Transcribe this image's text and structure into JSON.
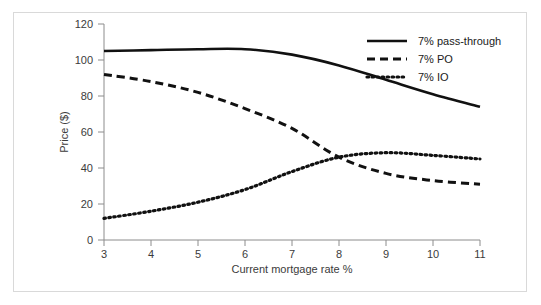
{
  "chart_data": {
    "type": "line",
    "title": "",
    "xlabel": "Current mortgage rate %",
    "ylabel": "Price ($)",
    "xlim": [
      3,
      11
    ],
    "ylim": [
      0,
      120
    ],
    "xticks": [
      "3",
      "4",
      "5",
      "6",
      "7",
      "8",
      "9",
      "10",
      "11"
    ],
    "yticks": [
      "0",
      "20",
      "40",
      "60",
      "80",
      "100",
      "120"
    ],
    "grid": false,
    "legend_position": "top-right",
    "x": [
      3,
      4,
      5,
      6,
      7,
      8,
      9,
      10,
      11
    ],
    "series": [
      {
        "name": "7% pass-through",
        "style": "solid",
        "color": "#111111",
        "values": [
          105,
          105.5,
          106,
          106,
          103,
          97,
          89,
          81,
          74
        ]
      },
      {
        "name": "7% PO",
        "style": "dashed",
        "color": "#111111",
        "values": [
          92,
          88,
          82,
          73,
          62,
          46,
          37,
          33,
          31
        ]
      },
      {
        "name": "7% IO",
        "style": "dotted",
        "color": "#111111",
        "values": [
          12,
          16,
          21,
          28,
          38,
          46,
          48.5,
          47,
          45
        ]
      }
    ]
  },
  "axes": {
    "x_axis_label": "Current mortgage rate %",
    "y_axis_label": "Price ($)",
    "x_tick_labels": [
      "3",
      "4",
      "5",
      "6",
      "7",
      "8",
      "9",
      "10",
      "11"
    ],
    "y_tick_labels": [
      "0",
      "20",
      "40",
      "60",
      "80",
      "100",
      "120"
    ]
  },
  "legend": {
    "items": [
      {
        "label": "7% pass-through",
        "style": "solid"
      },
      {
        "label": "7% PO",
        "style": "dashed"
      },
      {
        "label": "7% IO",
        "style": "dotted"
      }
    ]
  },
  "colors": {
    "line": "#111111",
    "axis": "#8c8c8c",
    "text": "#3b3b3b",
    "frame": "#d9d9d9",
    "background": "#ffffff"
  }
}
